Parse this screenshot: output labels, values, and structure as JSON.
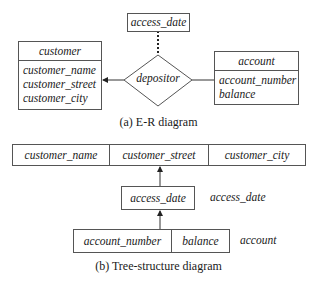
{
  "er_diagram": {
    "caption": "(a) E-R diagram",
    "relationship_attribute": "access_date",
    "relationship": "depositor",
    "entities": [
      {
        "name": "customer",
        "attributes": [
          "customer_name",
          "customer_street",
          "customer_city"
        ]
      },
      {
        "name": "account",
        "attributes": [
          "account_number",
          "balance"
        ]
      }
    ]
  },
  "tree_diagram": {
    "caption": "(b) Tree-structure diagram",
    "root_record": {
      "fields": [
        "customer_name",
        "customer_street",
        "customer_city"
      ]
    },
    "middle_record": {
      "fields": [
        "access_date"
      ],
      "label": "access_date"
    },
    "leaf_record": {
      "fields": [
        "account_number",
        "balance"
      ],
      "label": "account"
    }
  },
  "colors": {
    "line": "#555555",
    "text": "#1a1a1a",
    "background": "#ffffff"
  }
}
